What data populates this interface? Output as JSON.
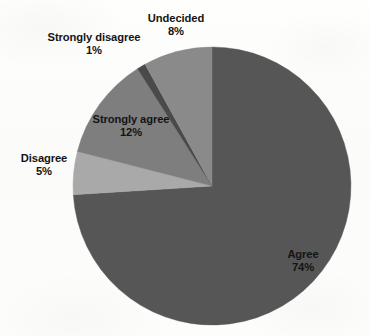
{
  "chart_data": {
    "type": "pie",
    "title": "",
    "categories": [
      "Agree",
      "Undecided",
      "Strongly disagree",
      "Strongly agree",
      "Disagree"
    ],
    "values": [
      74,
      8,
      1,
      12,
      5
    ],
    "value_suffix": "%",
    "labels": [
      {
        "name": "Agree",
        "value": "74%",
        "color": "#565656",
        "placement": "inside"
      },
      {
        "name": "Undecided",
        "value": "8%",
        "color": "#8a8a8a",
        "placement": "outside"
      },
      {
        "name": "Strongly disagree",
        "value": "1%",
        "color": "#4a4a4a",
        "placement": "outside"
      },
      {
        "name": "Strongly agree",
        "value": "12%",
        "color": "#7e7e7e",
        "placement": "inside"
      },
      {
        "name": "Disagree",
        "value": "5%",
        "color": "#a9a9a9",
        "placement": "outside"
      }
    ],
    "legend": "none",
    "grid": false,
    "start_angle_deg": 0,
    "direction": "clockwise",
    "xlabel": "",
    "ylabel": ""
  },
  "pie": {
    "center_x": 212,
    "center_y": 186,
    "radius": 139,
    "slices": [
      {
        "name": "Agree",
        "percent": 74,
        "color": "#565656"
      },
      {
        "name": "Disagree",
        "percent": 5,
        "color": "#a9a9a9"
      },
      {
        "name": "Strongly agree",
        "percent": 12,
        "color": "#7e7e7e"
      },
      {
        "name": "Strongly disagree",
        "percent": 1,
        "color": "#4a4a4a"
      },
      {
        "name": "Undecided",
        "percent": 8,
        "color": "#8a8a8a"
      }
    ]
  },
  "colors": {
    "background": "#fdfdfc",
    "text": "#141414",
    "agree": "#565656",
    "undecided": "#8a8a8a",
    "strongly_disagree": "#4a4a4a",
    "strongly_agree": "#7e7e7e",
    "disagree": "#a9a9a9"
  }
}
